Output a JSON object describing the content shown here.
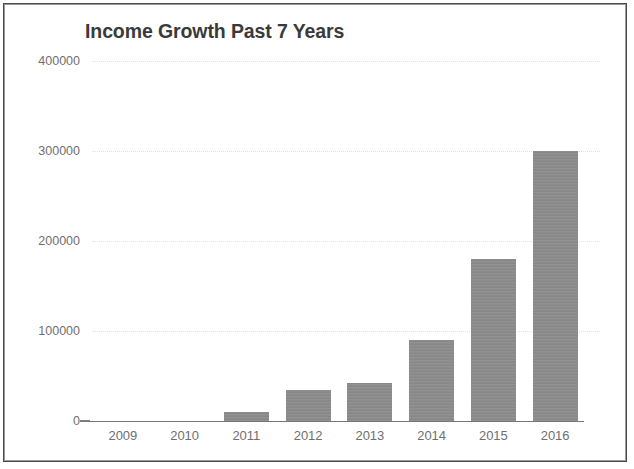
{
  "document": {
    "kind": "scanned-bar-chart-figure",
    "frame_color": "#4a4a4a",
    "background_color": "#ffffff"
  },
  "chart_data": {
    "type": "bar",
    "title": "Income Growth Past 7 Years",
    "subtitle": "",
    "xlabel": "",
    "ylabel": "",
    "categories": [
      "2009",
      "2010",
      "2011",
      "2012",
      "2013",
      "2014",
      "2015",
      "2016"
    ],
    "values": [
      0,
      0,
      10000,
      35000,
      42000,
      90000,
      180000,
      300000
    ],
    "ylim": [
      0,
      400000
    ],
    "yticks": [
      0,
      100000,
      200000,
      300000,
      400000
    ],
    "ytick_labels": [
      "0",
      "100000",
      "200000",
      "300000",
      "400000"
    ],
    "grid": true,
    "grid_axis": "y",
    "legend": false,
    "legend_position": "none",
    "bar_color": "#8a8a8a",
    "axis_color": "#777777",
    "tick_label_color": "#6f6f6f",
    "title_color": "#3a3a3a",
    "gridline_color": "#e2e2e2",
    "series": [
      {
        "name": "Income",
        "values": [
          0,
          0,
          10000,
          35000,
          42000,
          90000,
          180000,
          300000
        ]
      }
    ]
  }
}
